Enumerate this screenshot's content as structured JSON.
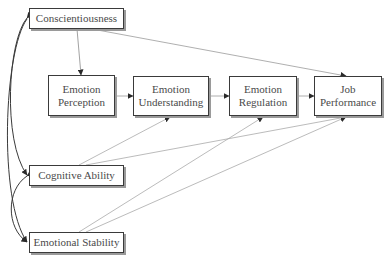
{
  "diagram": {
    "type": "path-model",
    "nodes": [
      {
        "id": "conscientiousness",
        "label": "Conscientiousness",
        "x": 29,
        "y": 8,
        "w": 95,
        "h": 21
      },
      {
        "id": "emotion_perception",
        "label": "Emotion\nPerception",
        "x": 48,
        "y": 75,
        "w": 67,
        "h": 41
      },
      {
        "id": "emotion_understanding",
        "label": "Emotion\nUnderstanding",
        "x": 133,
        "y": 76,
        "w": 76,
        "h": 40
      },
      {
        "id": "emotion_regulation",
        "label": "Emotion\nRegulation",
        "x": 229,
        "y": 76,
        "w": 68,
        "h": 40
      },
      {
        "id": "job_performance",
        "label": "Job\nPerformance",
        "x": 314,
        "y": 76,
        "w": 68,
        "h": 40
      },
      {
        "id": "cognitive_ability",
        "label": "Cognitive Ability",
        "x": 29,
        "y": 165,
        "w": 95,
        "h": 21
      },
      {
        "id": "emotional_stability",
        "label": "Emotional Stability",
        "x": 29,
        "y": 232,
        "w": 95,
        "h": 21
      }
    ],
    "edges": [
      {
        "from": "conscientiousness",
        "to": "emotion_perception",
        "type": "directed"
      },
      {
        "from": "conscientiousness",
        "to": "job_performance",
        "type": "directed"
      },
      {
        "from": "emotion_perception",
        "to": "emotion_understanding",
        "type": "directed"
      },
      {
        "from": "emotion_understanding",
        "to": "emotion_regulation",
        "type": "directed"
      },
      {
        "from": "emotion_regulation",
        "to": "job_performance",
        "type": "directed"
      },
      {
        "from": "cognitive_ability",
        "to": "emotion_understanding",
        "type": "directed"
      },
      {
        "from": "cognitive_ability",
        "to": "job_performance",
        "type": "directed"
      },
      {
        "from": "emotional_stability",
        "to": "emotion_regulation",
        "type": "directed"
      },
      {
        "from": "emotional_stability",
        "to": "job_performance",
        "type": "directed"
      },
      {
        "from": "conscientiousness",
        "to": "cognitive_ability",
        "type": "correlation"
      },
      {
        "from": "conscientiousness",
        "to": "emotional_stability",
        "type": "correlation"
      },
      {
        "from": "cognitive_ability",
        "to": "emotional_stability",
        "type": "correlation"
      }
    ]
  },
  "colors": {
    "box_border": "#3a3a3a",
    "box_shadow": "#9a9a9a",
    "text": "#4a4a4a",
    "line": "#a0a0a0",
    "arrowhead": "#2a2a2a",
    "correlation": "#3a3a3a"
  }
}
